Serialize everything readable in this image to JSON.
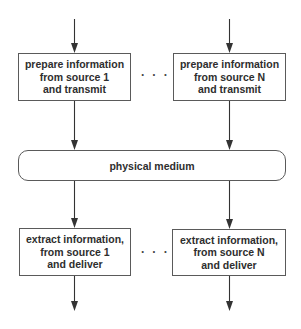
{
  "diagram": {
    "type": "block-diagram",
    "transmitters": [
      {
        "id": "tx-1",
        "lines": [
          "prepare information",
          "from source 1",
          "and transmit"
        ]
      },
      {
        "id": "tx-n",
        "lines": [
          "prepare information",
          "from source N",
          "and transmit"
        ]
      }
    ],
    "transmitter_ellipsis": "· · ·",
    "medium": {
      "label": "physical medium"
    },
    "receivers": [
      {
        "id": "rx-1",
        "lines": [
          "extract information,",
          "from source 1",
          "and deliver"
        ]
      },
      {
        "id": "rx-n",
        "lines": [
          "extract information,",
          "from source N",
          "and deliver"
        ]
      }
    ],
    "receiver_ellipsis": "· · ·",
    "edges": [
      {
        "from": "input-1",
        "to": "tx-1"
      },
      {
        "from": "input-n",
        "to": "tx-n"
      },
      {
        "from": "tx-1",
        "to": "physical medium"
      },
      {
        "from": "tx-n",
        "to": "physical medium"
      },
      {
        "from": "physical medium",
        "to": "rx-1"
      },
      {
        "from": "physical medium",
        "to": "rx-n"
      },
      {
        "from": "rx-1",
        "to": "output-1"
      },
      {
        "from": "rx-n",
        "to": "output-n"
      }
    ],
    "colors": {
      "stroke": "#5a5a5a",
      "arrow": "#333333",
      "text": "#2e2e2e",
      "background": "#ffffff"
    }
  }
}
